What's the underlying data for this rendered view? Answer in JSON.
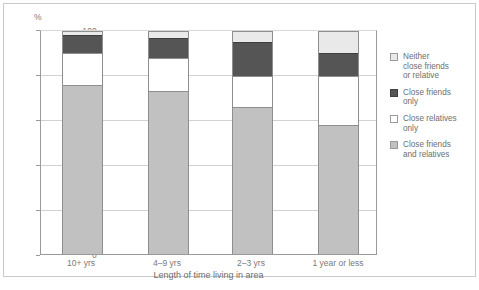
{
  "chart_data": {
    "type": "bar",
    "stacked": true,
    "title": "",
    "xlabel": "Length of time living in area",
    "ylabel": "%",
    "ylim": [
      0,
      100
    ],
    "yticks": [
      "0",
      "20",
      "40",
      "60",
      "80",
      "100"
    ],
    "grid": true,
    "legend_position": "right",
    "categories": [
      "10+ yrs",
      "4–9 yrs",
      "2–3 yrs",
      "1 year or less"
    ],
    "series": [
      {
        "name": "Close friends and relatives",
        "color": "#c1c1c1",
        "values": [
          76,
          73,
          66,
          58
        ]
      },
      {
        "name": "Close relatives only",
        "color": "#ffffff",
        "values": [
          14,
          15,
          14,
          22
        ]
      },
      {
        "name": "Close friends only",
        "color": "#555555",
        "values": [
          8,
          9,
          15,
          10
        ]
      },
      {
        "name": "Neither close friends or relative",
        "color": "#e9e9e9",
        "values": [
          2,
          3,
          5,
          10
        ]
      }
    ]
  },
  "axis": {
    "y_label": "%",
    "y_ticks": [
      "100",
      "80",
      "60",
      "40",
      "20",
      "0"
    ],
    "x_title": "Length of time living in area",
    "x_ticks": [
      "10+ yrs",
      "4–9 yrs",
      "2–3 yrs",
      "1 year or less"
    ]
  },
  "legend": {
    "items": [
      {
        "label_line1": "Neither",
        "label_line2": "close friends",
        "label_line3": "or relative",
        "color": "#e9e9e9"
      },
      {
        "label_line1": "Close friends",
        "label_line2": "only",
        "label_line3": "",
        "color": "#555555"
      },
      {
        "label_line1": "Close relatives",
        "label_line2": "only",
        "label_line3": "",
        "color": "#ffffff"
      },
      {
        "label_line1": "Close friends",
        "label_line2": "and relatives",
        "label_line3": "",
        "color": "#c1c1c1"
      }
    ]
  }
}
